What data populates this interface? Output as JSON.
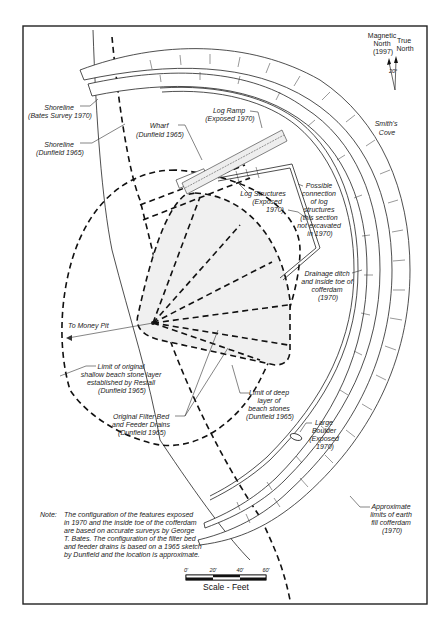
{
  "north_arrow": {
    "magnetic_label": [
      "Magnetic",
      "North",
      "(1997)"
    ],
    "true_label": [
      "True",
      "North"
    ],
    "declination": "20°"
  },
  "labels": {
    "smiths_cove": [
      "Smith's",
      "Cove"
    ],
    "shoreline_bates": [
      "Shoreline",
      "(Bates Survey 1970)"
    ],
    "shoreline_dunfield": [
      "Shoreline",
      "(Dunfield 1965)"
    ],
    "wharf": [
      "Wharf",
      "(Dunfield 1965)"
    ],
    "log_ramp": [
      "Log Ramp",
      "(Exposed 1970)"
    ],
    "log_structures": [
      "Log Structures",
      "(Exposed",
      "1970)"
    ],
    "possible_connection": [
      "Possible",
      "connection",
      "of log",
      "structures",
      "(this section",
      "not excavated",
      "in 1970)"
    ],
    "drainage_ditch": [
      "Drainage ditch",
      "and inside toe of",
      "cofferdam",
      "(1970)"
    ],
    "to_money_pit": "To Money Pit",
    "limit_shallow": [
      "Limit of  original",
      "shallow beach stone layer",
      "established by Restall",
      "(Dunfield 1965)"
    ],
    "limit_deep": [
      "Limit of  deep",
      "layer of",
      "beach stones",
      "(Dunfield 1965)"
    ],
    "filter_bed": [
      "Original Filter Bed",
      "and Feeder Drains",
      "(Dunfield 1965)"
    ],
    "large_boulder": [
      "Large",
      "Boulder",
      "(Exposed",
      "1970)"
    ],
    "cofferdam_limits": [
      "Approximate",
      "limits of earth",
      "fill cofferdam",
      "(1970)"
    ]
  },
  "note": {
    "prefix": "Note:",
    "lines": [
      "The configuration of the features exposed",
      "in 1970 and the inside toe of the cofferdam",
      "are based on accurate surveys by George",
      "T. Bates. The configuration of the filter bed",
      " and feeder drains is based on a 1965 sketch",
      "by Dunfield and the location is approximate."
    ]
  },
  "scale": {
    "title": "Scale - Feet",
    "ticks": [
      "0'",
      "20'",
      "40'",
      "60'"
    ]
  }
}
